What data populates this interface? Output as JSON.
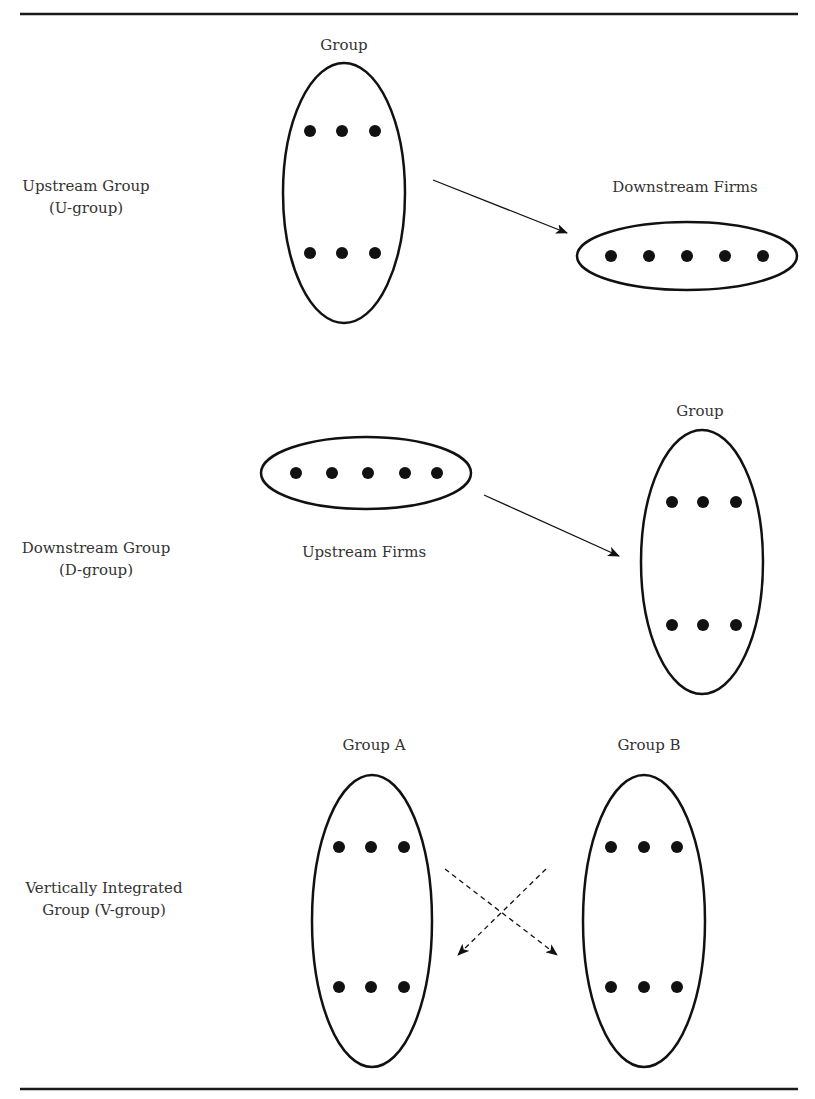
{
  "figure": {
    "rules": {
      "top_y": 14,
      "bottom_y": 1089,
      "x_start": 20,
      "x_end": 798,
      "color": "#1a1a1a"
    },
    "rows": [
      {
        "id": "u-group",
        "row_label": [
          "Upstream Group",
          "(U-group)"
        ],
        "group_label": "Group",
        "firms_label": "Downstream Firms",
        "group_dots": 6,
        "firms_dots": 5,
        "arrow": "solid",
        "direction": "group-to-firms"
      },
      {
        "id": "d-group",
        "row_label": [
          "Downstream Group",
          "(D-group)"
        ],
        "group_label": "Group",
        "firms_label": "Upstream Firms",
        "group_dots": 6,
        "firms_dots": 5,
        "arrow": "solid",
        "direction": "firms-to-group"
      },
      {
        "id": "v-group",
        "row_label": [
          "Vertically Integrated",
          "Group (V-group)"
        ],
        "group_a_label": "Group A",
        "group_b_label": "Group B",
        "group_a_dots": 6,
        "group_b_dots": 6,
        "arrow": "dashed",
        "direction": "crossing-bidirectional"
      }
    ],
    "colors": {
      "stroke": "#111111",
      "dot": "#111111",
      "text": "#333333",
      "background": "#ffffff"
    }
  }
}
